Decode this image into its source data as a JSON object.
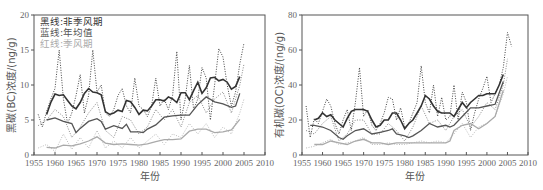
{
  "chart_data": [
    {
      "type": "line",
      "id": "bc",
      "title": "",
      "xlabel": "年份",
      "ylabel": "黑碳(BC)浓度/(ng/g)",
      "xlim": [
        1955,
        2010
      ],
      "ylim": [
        0,
        20
      ],
      "xticks": [
        "1955",
        "1960",
        "1965",
        "1970",
        "1975",
        "1980",
        "1985",
        "1990",
        "1995",
        "2000",
        "2005",
        "2010"
      ],
      "yticks": [
        "0",
        "5",
        "10",
        "15",
        "20"
      ],
      "grid": false,
      "legend": {
        "position": "upper-left",
        "entries": [
          {
            "label": "黑线:非季风期",
            "color": "#333333"
          },
          {
            "label": "蓝线:年均值",
            "color": "#555555"
          },
          {
            "label": "红线:季风期",
            "color": "#aaaaaa"
          }
        ]
      },
      "series": [
        {
          "name": "非季风期 (raw)",
          "style": "dotted",
          "color": "#444444",
          "x": [
            1956,
            1957,
            1958,
            1959,
            1960,
            1961,
            1962,
            1963,
            1964,
            1965,
            1966,
            1967,
            1968,
            1969,
            1970,
            1971,
            1972,
            1973,
            1974,
            1975,
            1976,
            1977,
            1978,
            1979,
            1980,
            1981,
            1982,
            1983,
            1984,
            1985,
            1986,
            1987,
            1988,
            1989,
            1990,
            1991,
            1992,
            1993,
            1994,
            1995,
            1996,
            1997,
            1998,
            1999,
            2000,
            2001,
            2002,
            2003,
            2004,
            2005
          ],
          "y": [
            5.8,
            4.0,
            6.2,
            8.0,
            9.5,
            15.0,
            8.0,
            4.5,
            6.0,
            8.5,
            11.5,
            6.0,
            8.5,
            15.0,
            9.0,
            10.0,
            6.0,
            5.5,
            6.5,
            8.5,
            9.5,
            7.0,
            6.0,
            11.0,
            7.0,
            6.5,
            5.5,
            7.0,
            11.0,
            7.0,
            8.0,
            6.5,
            8.5,
            14.8,
            5.0,
            8.0,
            12.8,
            6.5,
            8.0,
            12.5,
            11.0,
            5.0,
            10.0,
            15.2,
            14.0,
            10.0,
            7.0,
            9.0,
            13.0,
            16.0
          ]
        },
        {
          "name": "非季风期 (smoothed)",
          "style": "solid",
          "color": "#333333",
          "x": [
            1958,
            1959,
            1960,
            1961,
            1962,
            1963,
            1964,
            1965,
            1966,
            1967,
            1968,
            1969,
            1970,
            1971,
            1972,
            1973,
            1974,
            1975,
            1976,
            1977,
            1978,
            1979,
            1980,
            1981,
            1982,
            1983,
            1984,
            1985,
            1986,
            1987,
            1988,
            1989,
            1990,
            1991,
            1992,
            1993,
            1994,
            1995,
            1996,
            1997,
            1998,
            1999,
            2000,
            2001,
            2002,
            2003,
            2004
          ],
          "y": [
            5.8,
            7.5,
            8.7,
            8.5,
            8.6,
            7.8,
            7.0,
            6.6,
            7.5,
            8.8,
            9.5,
            9.0,
            8.9,
            8.6,
            6.2,
            5.8,
            6.0,
            6.4,
            6.2,
            7.8,
            7.6,
            6.8,
            5.8,
            6.4,
            6.3,
            7.0,
            7.9,
            7.9,
            7.7,
            8.3,
            8.0,
            7.5,
            8.9,
            8.9,
            7.9,
            9.2,
            10.4,
            8.8,
            9.6,
            11.0,
            11.1,
            10.6,
            10.8,
            10.4,
            9.4,
            9.8,
            11.2
          ]
        },
        {
          "name": "年均值 (raw)",
          "style": "dotted",
          "color": "#888888",
          "x": [
            1956,
            1958,
            1960,
            1962,
            1964,
            1966,
            1968,
            1970,
            1972,
            1974,
            1976,
            1978,
            1980,
            1982,
            1984,
            1986,
            1988,
            1990,
            1992,
            1994,
            1996,
            1998,
            2000,
            2002,
            2004,
            2005
          ],
          "y": [
            4.2,
            5.0,
            6.5,
            5.5,
            2.5,
            4.0,
            6.0,
            7.5,
            3.5,
            2.5,
            5.5,
            5.0,
            3.0,
            4.0,
            6.5,
            5.0,
            6.5,
            4.0,
            7.5,
            8.5,
            6.0,
            8.0,
            9.0,
            6.0,
            10.0,
            13.0
          ]
        },
        {
          "name": "年均值 (smoothed)",
          "style": "solid",
          "color": "#555555",
          "x": [
            1958,
            1960,
            1962,
            1964,
            1965,
            1966,
            1968,
            1970,
            1971,
            1972,
            1974,
            1976,
            1977,
            1978,
            1980,
            1981,
            1982,
            1984,
            1986,
            1988,
            1990,
            1992,
            1994,
            1996,
            1998,
            2000,
            2002,
            2003,
            2004
          ],
          "y": [
            5.0,
            5.3,
            4.8,
            4.5,
            3.2,
            3.8,
            4.8,
            5.2,
            4.8,
            3.7,
            4.2,
            3.8,
            4.4,
            3.3,
            3.3,
            3.2,
            3.7,
            4.3,
            5.4,
            5.6,
            5.7,
            5.7,
            7.2,
            8.3,
            7.6,
            7.3,
            6.8,
            7.0,
            8.8
          ]
        },
        {
          "name": "季风期 (raw)",
          "style": "dotted",
          "color": "#bbbbbb",
          "x": [
            1956,
            1958,
            1960,
            1962,
            1964,
            1966,
            1968,
            1970,
            1972,
            1974,
            1976,
            1978,
            1980,
            1982,
            1984,
            1986,
            1988,
            1990,
            1992,
            1994,
            1996,
            1998,
            2000,
            2002,
            2004,
            2005
          ],
          "y": [
            1.0,
            1.5,
            0.5,
            3.0,
            0.8,
            2.5,
            1.0,
            3.5,
            1.0,
            2.0,
            1.0,
            2.5,
            1.0,
            2.0,
            3.0,
            1.5,
            3.0,
            2.5,
            4.5,
            3.0,
            4.5,
            2.5,
            4.0,
            3.0,
            6.0,
            8.0
          ]
        },
        {
          "name": "季风期 (smoothed)",
          "style": "solid",
          "color": "#aaaaaa",
          "x": [
            1958,
            1960,
            1962,
            1964,
            1966,
            1968,
            1970,
            1972,
            1974,
            1976,
            1978,
            1980,
            1982,
            1984,
            1986,
            1988,
            1990,
            1992,
            1994,
            1996,
            1998,
            2000,
            2002,
            2004
          ],
          "y": [
            1.1,
            1.0,
            1.4,
            1.3,
            1.6,
            2.0,
            2.6,
            1.7,
            1.5,
            1.6,
            1.5,
            1.4,
            1.6,
            1.9,
            2.2,
            2.2,
            2.3,
            3.4,
            3.7,
            3.7,
            3.2,
            3.3,
            3.6,
            5.1
          ]
        }
      ]
    },
    {
      "type": "line",
      "id": "oc",
      "title": "",
      "xlabel": "年份",
      "ylabel": "有机碳(OC)浓度/(ng/g)",
      "xlim": [
        1955,
        2010
      ],
      "ylim": [
        0,
        80
      ],
      "xticks": [
        "1955",
        "1960",
        "1965",
        "1970",
        "1975",
        "1980",
        "1985",
        "1990",
        "1995",
        "2000",
        "2005",
        "2010"
      ],
      "yticks": [
        "0",
        "20",
        "40",
        "60",
        "80"
      ],
      "grid": false,
      "series": [
        {
          "name": "非季风期 (raw)",
          "style": "dotted",
          "color": "#444444",
          "x": [
            1956,
            1957,
            1958,
            1959,
            1960,
            1961,
            1962,
            1963,
            1964,
            1965,
            1966,
            1967,
            1968,
            1969,
            1970,
            1971,
            1972,
            1973,
            1974,
            1975,
            1976,
            1977,
            1978,
            1979,
            1980,
            1981,
            1982,
            1983,
            1984,
            1985,
            1986,
            1987,
            1988,
            1989,
            1990,
            1991,
            1992,
            1993,
            1994,
            1995,
            1996,
            1997,
            1998,
            1999,
            2000,
            2001,
            2002,
            2003,
            2004,
            2005,
            2006
          ],
          "y": [
            28,
            10,
            21,
            18,
            25,
            32,
            28,
            18,
            12,
            20,
            26,
            14,
            30,
            50,
            22,
            26,
            17,
            14,
            18,
            24,
            33,
            32,
            20,
            27,
            16,
            18,
            24,
            30,
            51,
            30,
            24,
            40,
            22,
            33,
            20,
            22,
            40,
            20,
            36,
            30,
            14,
            24,
            32,
            38,
            45,
            30,
            35,
            40,
            50,
            70,
            62
          ]
        },
        {
          "name": "非季风期 (smoothed)",
          "style": "solid",
          "color": "#333333",
          "x": [
            1958,
            1959,
            1960,
            1961,
            1962,
            1963,
            1964,
            1965,
            1966,
            1967,
            1968,
            1969,
            1970,
            1971,
            1972,
            1973,
            1974,
            1975,
            1976,
            1977,
            1978,
            1979,
            1980,
            1981,
            1982,
            1983,
            1984,
            1985,
            1986,
            1987,
            1988,
            1989,
            1990,
            1991,
            1992,
            1993,
            1994,
            1995,
            1996,
            1997,
            1998,
            1999,
            2000,
            2001,
            2002,
            2003,
            2004
          ],
          "y": [
            20,
            21,
            24,
            22,
            23,
            20,
            18,
            16,
            21,
            25,
            26,
            26,
            26,
            25,
            20,
            16,
            17,
            20,
            20,
            24,
            24,
            20,
            15,
            18,
            20,
            24,
            28,
            34,
            32,
            28,
            25,
            24,
            24,
            24,
            22,
            26,
            30,
            27,
            30,
            32,
            34,
            34,
            35,
            35,
            35,
            40,
            46
          ]
        },
        {
          "name": "年均值 (raw)",
          "style": "dotted",
          "color": "#888888",
          "x": [
            1956,
            1958,
            1960,
            1962,
            1964,
            1966,
            1968,
            1970,
            1972,
            1974,
            1976,
            1978,
            1980,
            1982,
            1984,
            1986,
            1988,
            1990,
            1992,
            1994,
            1996,
            1998,
            2000,
            2002,
            2004,
            2005
          ],
          "y": [
            14,
            12,
            18,
            22,
            8,
            12,
            20,
            20,
            12,
            12,
            18,
            14,
            8,
            16,
            28,
            18,
            20,
            14,
            22,
            26,
            16,
            22,
            30,
            26,
            40,
            55
          ]
        },
        {
          "name": "年均值 (smoothed)",
          "style": "solid",
          "color": "#555555",
          "x": [
            1957,
            1958,
            1960,
            1962,
            1964,
            1965,
            1966,
            1968,
            1970,
            1972,
            1974,
            1976,
            1977,
            1978,
            1980,
            1981,
            1982,
            1984,
            1986,
            1988,
            1990,
            1991,
            1992,
            1994,
            1996,
            1998,
            2000,
            2002,
            2004
          ],
          "y": [
            17,
            17,
            16,
            14,
            10,
            9,
            11,
            14,
            15,
            12,
            13,
            14,
            15,
            12,
            11,
            10,
            11,
            14,
            18,
            16,
            17,
            16,
            17,
            22,
            27,
            27,
            28,
            29,
            42
          ]
        },
        {
          "name": "季风期 (raw)",
          "style": "dotted",
          "color": "#bbbbbb",
          "x": [
            1956,
            1958,
            1960,
            1962,
            1964,
            1966,
            1968,
            1970,
            1972,
            1974,
            1976,
            1978,
            1980,
            1982,
            1984,
            1986,
            1988,
            1990,
            1992,
            1994,
            1996,
            1998,
            2000,
            2002,
            2004,
            2005
          ],
          "y": [
            4,
            5,
            7,
            9,
            6,
            7,
            8,
            10,
            6,
            6,
            7,
            6,
            6,
            7,
            8,
            7,
            8,
            7,
            12,
            18,
            10,
            16,
            18,
            22,
            35,
            45
          ]
        },
        {
          "name": "季风期 (smoothed)",
          "style": "solid",
          "color": "#aaaaaa",
          "x": [
            1958,
            1960,
            1962,
            1964,
            1966,
            1968,
            1970,
            1972,
            1974,
            1976,
            1978,
            1980,
            1982,
            1984,
            1986,
            1988,
            1990,
            1991,
            1992,
            1994,
            1996,
            1998,
            2000,
            2002,
            2004
          ],
          "y": [
            6,
            6,
            8,
            7,
            6,
            8,
            9,
            7,
            7,
            6,
            7,
            7,
            7,
            7,
            7,
            7,
            7,
            8,
            14,
            17,
            18,
            15,
            18,
            22,
            37
          ]
        }
      ]
    }
  ]
}
